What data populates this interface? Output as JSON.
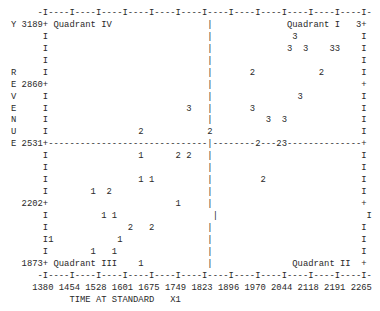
{
  "plot": {
    "lines": [
      "     -I----I----I----I----I----I----I----I----I----I----I----I----I-",
      "Y 3189+ Quadrant IV                  |              Quadrant I   3+",
      "      I                              |               3            I",
      "      I                              |              3  3    33    I",
      "      I                              |                            I",
      "R     I                              |       2            2       I",
      "E 2860+                              |                            +",
      "V     I                              |                3           I",
      "E     I                          3   |       3                    I",
      "N     I                              |          3  3              I",
      "U     I                 2            2                            I",
      "E 2531+------------------------------|--------2---23--------------+",
      "      I                 1      2 2   |                            I",
      "      I                              |                            I",
      "      I                 1 1          |         2                  I",
      "      I        1  2                  |                            I",
      "  2202+                        1     |                            +",
      "      I          1 1                  |                            I",
      "      I               2   2          |                            I",
      "      I1            1                |                            I",
      "      I        1   1                 |                            I",
      "  1873+ Quadrant III    1            |               Quadrant II  +",
      "     -I----I----I----I----I----I----I----I----I----I----I----I----I-",
      "    1380 1454 1528 1601 1675 1749 1823 1896 1970 2044 2118 2191 2265",
      "           TIME AT STANDARD   X1"
    ]
  },
  "chart_data": {
    "type": "scatter",
    "title": "",
    "xlabel": "TIME AT STANDARD",
    "xlabel_suffix": "X1",
    "ylabel": "REVENUE",
    "ylabel_prefix": "Y",
    "x_ticks": [
      1380,
      1454,
      1528,
      1601,
      1675,
      1749,
      1823,
      1896,
      1970,
      2044,
      2118,
      2191,
      2265
    ],
    "y_ticks": [
      3189,
      2860,
      2531,
      2202,
      1873
    ],
    "xlim": [
      1380,
      2265
    ],
    "ylim": [
      1873,
      3189
    ],
    "divider_x": 1837,
    "divider_y": 2531,
    "quadrant_labels": [
      "Quadrant I",
      "Quadrant II",
      "Quadrant III",
      "Quadrant IV"
    ],
    "marker_note": "Digits indicate group/label symbols plotted at each point",
    "points": [
      {
        "x": 2236,
        "y": 3189,
        "label": "3"
      },
      {
        "x": 2073,
        "y": 3123,
        "label": "3"
      },
      {
        "x": 2059,
        "y": 3057,
        "label": "3"
      },
      {
        "x": 2103,
        "y": 3057,
        "label": "3"
      },
      {
        "x": 2177,
        "y": 3057,
        "label": "3"
      },
      {
        "x": 2191,
        "y": 3057,
        "label": "3"
      },
      {
        "x": 1955,
        "y": 2926,
        "label": "2"
      },
      {
        "x": 2147,
        "y": 2926,
        "label": "2"
      },
      {
        "x": 2088,
        "y": 2794,
        "label": "3"
      },
      {
        "x": 1778,
        "y": 2728,
        "label": "3"
      },
      {
        "x": 1955,
        "y": 2728,
        "label": "3"
      },
      {
        "x": 2000,
        "y": 2663,
        "label": "3"
      },
      {
        "x": 2044,
        "y": 2663,
        "label": "3"
      },
      {
        "x": 1646,
        "y": 2597,
        "label": "2"
      },
      {
        "x": 1837,
        "y": 2597,
        "label": "2"
      },
      {
        "x": 1970,
        "y": 2531,
        "label": "2"
      },
      {
        "x": 2029,
        "y": 2531,
        "label": "2"
      },
      {
        "x": 2044,
        "y": 2531,
        "label": "3"
      },
      {
        "x": 1646,
        "y": 2465,
        "label": "1"
      },
      {
        "x": 1749,
        "y": 2465,
        "label": "2"
      },
      {
        "x": 1778,
        "y": 2465,
        "label": "2"
      },
      {
        "x": 1646,
        "y": 2334,
        "label": "1"
      },
      {
        "x": 1675,
        "y": 2334,
        "label": "1"
      },
      {
        "x": 1985,
        "y": 2334,
        "label": "2"
      },
      {
        "x": 1513,
        "y": 2268,
        "label": "1"
      },
      {
        "x": 1557,
        "y": 2268,
        "label": "2"
      },
      {
        "x": 1749,
        "y": 2202,
        "label": "1"
      },
      {
        "x": 1542,
        "y": 2136,
        "label": "1"
      },
      {
        "x": 1572,
        "y": 2136,
        "label": "1"
      },
      {
        "x": 1616,
        "y": 2070,
        "label": "2"
      },
      {
        "x": 1675,
        "y": 2070,
        "label": "2"
      },
      {
        "x": 1395,
        "y": 2005,
        "label": "1"
      },
      {
        "x": 1587,
        "y": 2005,
        "label": "1"
      },
      {
        "x": 1513,
        "y": 1939,
        "label": "1"
      },
      {
        "x": 1572,
        "y": 1939,
        "label": "1"
      },
      {
        "x": 1646,
        "y": 1873,
        "label": "1"
      }
    ],
    "grid": false,
    "legend": null
  }
}
